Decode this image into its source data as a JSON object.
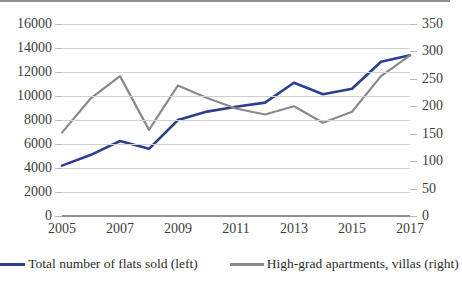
{
  "chart_data": {
    "type": "line",
    "title": "",
    "xlabel": "",
    "ylabel": "",
    "grid": true,
    "legend_position": "bottom",
    "x": [
      2005,
      2006,
      2007,
      2008,
      2009,
      2010,
      2011,
      2012,
      2013,
      2014,
      2015,
      2016,
      2017
    ],
    "x_tick_labels": [
      "2005",
      "2007",
      "2009",
      "2011",
      "2013",
      "2015",
      "2017"
    ],
    "axes": [
      {
        "id": "left",
        "side": "left",
        "label": "Total number of flats sold",
        "ylim": [
          0,
          16000
        ],
        "ticks": [
          0,
          2000,
          4000,
          6000,
          8000,
          10000,
          12000,
          14000,
          16000
        ],
        "tick_labels": [
          "0",
          "2000",
          "4000",
          "6000",
          "8000",
          "10000",
          "12000",
          "14000",
          "16000"
        ]
      },
      {
        "id": "right",
        "side": "right",
        "label": "High-grad apartments, villas",
        "ylim": [
          0,
          350
        ],
        "ticks": [
          0,
          50,
          100,
          150,
          200,
          250,
          300,
          350
        ],
        "tick_labels": [
          "0",
          "50",
          "100",
          "150",
          "200",
          "250",
          "300",
          "350"
        ]
      }
    ],
    "series": [
      {
        "name": "Total number of flats sold (left)",
        "axis": "left",
        "color": "#2e3f8f",
        "values": [
          4200,
          5100,
          6250,
          5600,
          8000,
          8700,
          9100,
          9450,
          11100,
          10150,
          10600,
          12850,
          13400
        ]
      },
      {
        "name": "High-grad apartments, villas (right)",
        "axis": "right",
        "color": "#8a8a8a",
        "values": [
          152,
          215,
          255,
          157,
          238,
          215,
          196,
          185,
          200,
          170,
          190,
          255,
          293
        ]
      }
    ],
    "legend": [
      {
        "label": "Total number of flats sold (left)",
        "color": "#2e3f8f"
      },
      {
        "label": "High-grad apartments, villas (right)",
        "color": "#8a8a8a"
      }
    ]
  }
}
